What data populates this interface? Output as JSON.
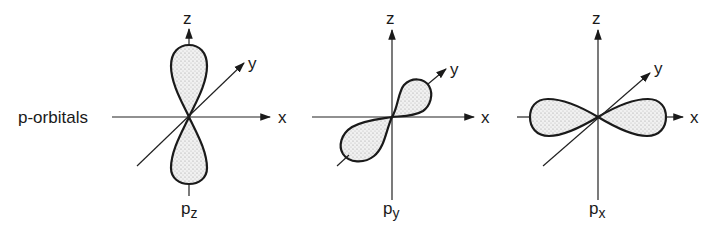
{
  "title": "p-orbitals",
  "panels": [
    {
      "id": "pz",
      "label_main": "p",
      "label_sub": "z",
      "axes": {
        "x": "x",
        "y": "y",
        "z": "z"
      },
      "orientation": "lobes along z axis"
    },
    {
      "id": "py",
      "label_main": "p",
      "label_sub": "y",
      "axes": {
        "x": "x",
        "y": "y",
        "z": "z"
      },
      "orientation": "lobes along y axis"
    },
    {
      "id": "px",
      "label_main": "p",
      "label_sub": "x",
      "axes": {
        "x": "x",
        "y": "y",
        "z": "z"
      },
      "orientation": "lobes along x axis"
    }
  ],
  "colors": {
    "line": "#1a1a1a",
    "fill_stipple": "#cfcfcf",
    "background": "#ffffff"
  }
}
